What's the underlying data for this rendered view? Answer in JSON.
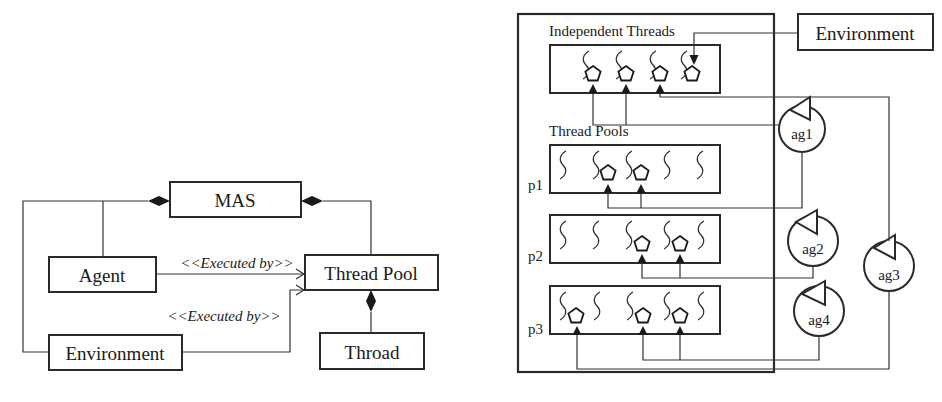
{
  "left_diagram": {
    "classes": {
      "mas": "MAS",
      "agent": "Agent",
      "thread_pool": "Thread Pool",
      "environment": "Environment",
      "thread": "Throad"
    },
    "relations": {
      "agent_to_pool": "<<Executed by>>",
      "env_to_pool": "<<Executed by>>"
    }
  },
  "right_diagram": {
    "independent_threads_label": "Independent Threads",
    "thread_pools_label": "Thread Pools",
    "environment_label": "Environment",
    "pools": [
      {
        "label": "p1"
      },
      {
        "label": "p2"
      },
      {
        "label": "p3"
      }
    ],
    "agents": [
      "ag1",
      "ag2",
      "ag3",
      "ag4"
    ]
  }
}
